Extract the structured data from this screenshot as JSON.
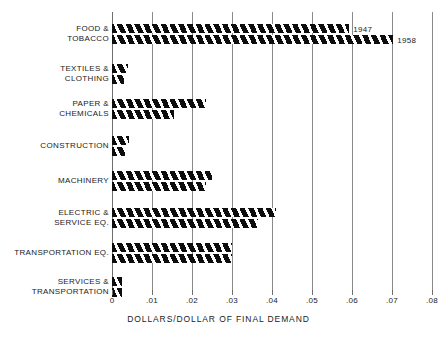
{
  "chart_data": {
    "type": "bar",
    "orientation": "horizontal",
    "title": "",
    "xlabel": "DOLLARS/DOLLAR OF FINAL DEMAND",
    "ylabel": "",
    "xlim": [
      0,
      0.08
    ],
    "xticks": [
      0,
      0.01,
      0.02,
      0.03,
      0.04,
      0.05,
      0.06,
      0.07,
      0.08
    ],
    "xticklabels": [
      "0",
      ".01",
      ".02",
      ".03",
      ".04",
      ".05",
      ".06",
      ".07",
      ".08"
    ],
    "grid": true,
    "grid_axis": "x",
    "legend": "annotated-at-bar-ends",
    "categories": [
      "FOOD &\nTOBACCO",
      "TEXTILES &\nCLOTHING",
      "PAPER &\nCHEMICALS",
      "CONSTRUCTION",
      "MACHINERY",
      "ELECTRIC &\nSERVICE EQ.",
      "TRANSPORTATION EQ.",
      "SERVICES &\nTRANSPORTATION"
    ],
    "series": [
      {
        "name": "1947",
        "values": [
          0.0593,
          0.004,
          0.0235,
          0.0043,
          0.025,
          0.041,
          0.03,
          0.0025
        ]
      },
      {
        "name": "1958",
        "values": [
          0.0703,
          0.003,
          0.0155,
          0.0033,
          0.0235,
          0.0365,
          0.03,
          0.0025
        ]
      }
    ],
    "annotations": [
      {
        "text": "1947",
        "category": "FOOD & TOBACCO",
        "series": "1947"
      },
      {
        "text": "1958",
        "category": "FOOD & TOBACCO",
        "series": "1958"
      }
    ],
    "colors": {
      "bar_fill": "#0d0d0d",
      "bar_hatch": "#ffffff",
      "gridline": "#8a8a8a",
      "background": "#ffffff",
      "text": "#1a1a1a"
    }
  },
  "categories_display": [
    {
      "line1": "FOOD &",
      "line2": "TOBACCO"
    },
    {
      "line1": "TEXTILES &",
      "line2": "CLOTHING"
    },
    {
      "line1": "PAPER &",
      "line2": "CHEMICALS"
    },
    {
      "line1": "CONSTRUCTION",
      "line2": ""
    },
    {
      "line1": "MACHINERY",
      "line2": ""
    },
    {
      "line1": "ELECTRIC &",
      "line2": "SERVICE EQ."
    },
    {
      "line1": "TRANSPORTATION EQ.",
      "line2": ""
    },
    {
      "line1": "SERVICES &",
      "line2": "TRANSPORTATION"
    }
  ]
}
